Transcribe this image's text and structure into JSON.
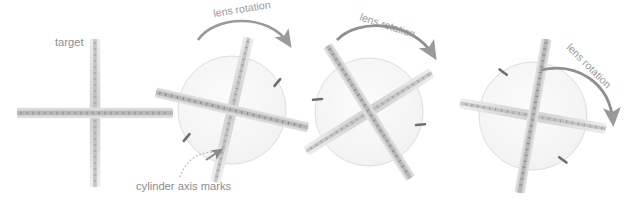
{
  "figure": {
    "background_color": "#ffffff",
    "width": 638,
    "height": 200
  },
  "labels": {
    "target": "target",
    "cylinder_axis_marks": "cylinder axis marks",
    "lens_rotation_1": "lens rotation",
    "lens_rotation_2": "lens rotation",
    "lens_rotation_3": "lens rotation"
  },
  "colors": {
    "bar_body": "#d2d2d2",
    "bar_core": "#a8a8a8",
    "bar_tick": "#7e7e7e",
    "lens_fill": "#f4f4f4",
    "lens_stroke": "#dcdcdc",
    "axis_mark": "#6f6f6f",
    "arrow": "#9a9a9a",
    "text": "#8d8d8d",
    "leader_line": "#b5b5b5"
  },
  "panels": [
    {
      "name": "target",
      "kind": "target-cross",
      "center_x": 95,
      "center_y": 113,
      "cross_rotation_deg": 0,
      "has_lens": false,
      "has_axis_marks": false,
      "label": "target"
    },
    {
      "name": "lens-position-1",
      "kind": "lens-with-cross",
      "center_x": 232,
      "center_y": 110,
      "lens_radius": 54,
      "cross_rotation_deg": 13,
      "has_lens": true,
      "has_axis_marks": true,
      "axis_mark_angle_deg": 13,
      "rotation_label": "lens rotation",
      "arrow_label_x": 254,
      "arrow_label_y": 18
    },
    {
      "name": "lens-position-2",
      "kind": "lens-with-cross",
      "center_x": 369,
      "center_y": 112,
      "lens_radius": 54,
      "cross_rotation_deg": 58,
      "has_lens": true,
      "has_axis_marks": true,
      "axis_mark_angle_deg": 58,
      "rotation_label": "lens rotation",
      "arrow_label_x": 400,
      "arrow_label_y": 22
    },
    {
      "name": "lens-position-3",
      "kind": "lens-with-cross",
      "center_x": 533,
      "center_y": 116,
      "lens_radius": 54,
      "cross_rotation_deg": 100,
      "has_lens": true,
      "has_axis_marks": true,
      "axis_mark_angle_deg": 100,
      "rotation_label": "lens rotation",
      "arrow_label_x": 575,
      "arrow_label_y": 45
    }
  ],
  "annotation": {
    "text": "cylinder axis marks",
    "text_x": 136,
    "text_y": 188,
    "leader_style": "dotted-curve",
    "arrowhead_points_to": "axis-mark-lower-left-of-lens-1"
  }
}
